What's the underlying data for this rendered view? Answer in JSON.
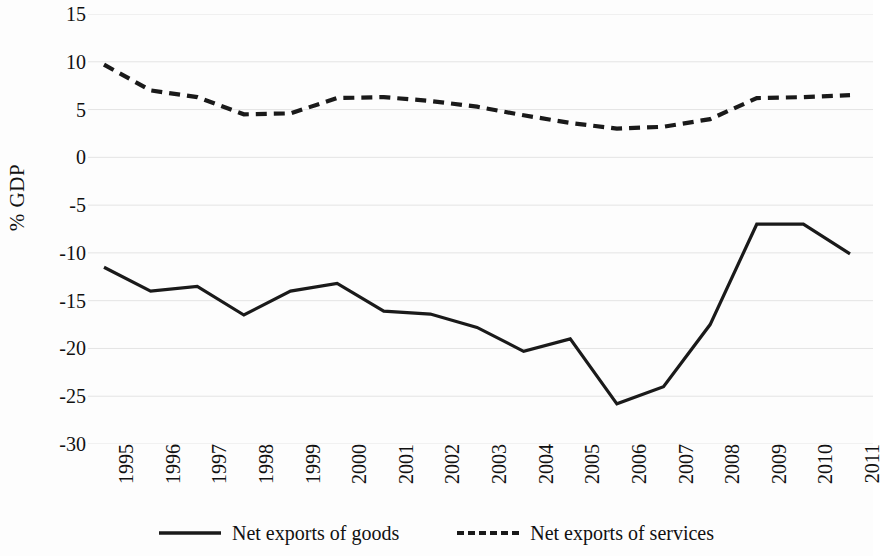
{
  "chart_data": {
    "type": "line",
    "title": "",
    "xlabel": "",
    "ylabel": "% GDP",
    "x": [
      1995,
      1996,
      1997,
      1998,
      1999,
      2000,
      2001,
      2002,
      2003,
      2004,
      2005,
      2006,
      2007,
      2008,
      2009,
      2010,
      2011
    ],
    "categories": [
      "1995",
      "1996",
      "1997",
      "1998",
      "1999",
      "2000",
      "2001",
      "2002",
      "2003",
      "2004",
      "2005",
      "2006",
      "2007",
      "2008",
      "2009",
      "2010",
      "2011"
    ],
    "series": [
      {
        "name": "Net exports of goods",
        "style": "solid",
        "color": "#1a1a1a",
        "values": [
          -11.5,
          -14.0,
          -13.5,
          -16.5,
          -14.0,
          -13.2,
          -16.1,
          -16.4,
          -17.8,
          -20.3,
          -19.0,
          -25.8,
          -24.0,
          -17.5,
          -7.0,
          -7.0,
          -10.1
        ]
      },
      {
        "name": "Net exports of services",
        "style": "dashed",
        "color": "#1a1a1a",
        "values": [
          9.7,
          7.0,
          6.3,
          4.5,
          4.6,
          6.2,
          6.3,
          5.9,
          5.3,
          4.4,
          3.6,
          3.0,
          3.2,
          4.0,
          6.2,
          6.3,
          6.5
        ]
      }
    ],
    "ylim": [
      -30,
      15
    ],
    "yticks": [
      15,
      10,
      5,
      0,
      -5,
      -10,
      -15,
      -20,
      -25,
      -30
    ],
    "ytick_labels": [
      "15",
      "10",
      "5",
      "0",
      "-5",
      "-10",
      "-15",
      "-20",
      "-25",
      "-30"
    ],
    "grid": true,
    "grid_color": "#e4e4e4",
    "legend_position": "bottom",
    "background": "#ffffff"
  },
  "legend": {
    "entries": [
      {
        "label": "Net exports of goods",
        "style": "solid"
      },
      {
        "label": "Net exports of services",
        "style": "dashed"
      }
    ]
  },
  "axes": {
    "y_title": "% GDP"
  }
}
